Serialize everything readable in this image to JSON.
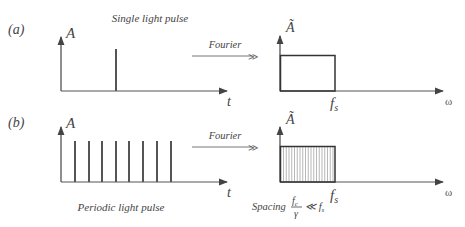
{
  "panel_a": {
    "label": "(a)",
    "title": "Single light pulse",
    "time_axis": {
      "y_label": "A",
      "x_label": "t"
    },
    "pulses_x": [
      116
    ],
    "arrow_label": "Fourier",
    "freq_axis": {
      "y_label": "Ã",
      "x_label": "ω",
      "cutoff_label": "f"
    },
    "cutoff_sub": "s"
  },
  "panel_b": {
    "label": "(b)",
    "title": "Periodic light pulse",
    "time_axis": {
      "y_label": "A",
      "x_label": "t"
    },
    "pulses_x": [
      75,
      89,
      102,
      116,
      129,
      143,
      157,
      171
    ],
    "arrow_label": "Fourier",
    "freq_axis": {
      "y_label": "Ã",
      "x_label": "ω",
      "cutoff_label": "f"
    },
    "cutoff_sub": "s",
    "spacing_text": "Spacing",
    "spacing_num": "f",
    "spacing_num_sub": "c",
    "spacing_den": "γ",
    "spacing_rel": "≪ f",
    "spacing_rel_sub": "s"
  },
  "colors": {
    "line": "#444444",
    "pulse": "#555555",
    "arrow": "#666666"
  }
}
